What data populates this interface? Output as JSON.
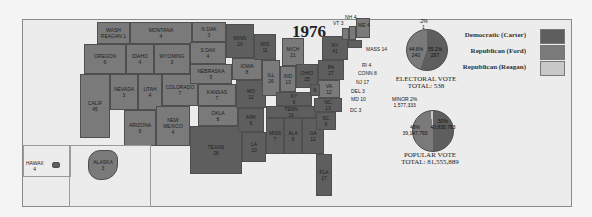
{
  "title": "1976",
  "legend": [
    {
      "label": "Democratic (Carter)",
      "color": "#5e5e5e"
    },
    {
      "label": "Republican (Ford)",
      "color": "#7a7a7a"
    },
    {
      "label": "Republican (Reagan)",
      "color": "#c8c8c8"
    }
  ],
  "electoral": {
    "caption": "ELECTORAL VOTE",
    "total": "TOTAL: 538",
    "ford_pct": "44.6%",
    "ford_votes": "240",
    "carter_pct": "55.2%",
    "carter_votes": "297",
    "reagan_pct": ".2%",
    "reagan_votes": "1"
  },
  "popular": {
    "caption": "POPULAR VOTE",
    "total": "TOTAL: 81,555,889",
    "minor_label": "MINOR 2%",
    "minor_votes": "1,577,333",
    "ford_pct": "48%",
    "ford_votes": "39,147,793",
    "carter_pct": "50%",
    "carter_votes": "40,830,763"
  },
  "states": {
    "wa": {
      "name": "WASH",
      "votes": "8",
      "note": "REAGAN 1"
    },
    "or": {
      "name": "OREGON",
      "votes": "6"
    },
    "ca": {
      "name": "CALIF",
      "votes": "45"
    },
    "nv": {
      "name": "NEVADA",
      "votes": "3"
    },
    "id": {
      "name": "IDAHO",
      "votes": "4"
    },
    "mt": {
      "name": "MONTANA",
      "votes": "4"
    },
    "wy": {
      "name": "WYOMING",
      "votes": "3"
    },
    "ut": {
      "name": "UTAH",
      "votes": "4"
    },
    "co": {
      "name": "COLORADO",
      "votes": "7"
    },
    "az": {
      "name": "ARIZONA",
      "votes": "6"
    },
    "nm": {
      "name": "NEW MEXICO",
      "votes": "4"
    },
    "nd": {
      "name": "N DAK",
      "votes": "3"
    },
    "sd": {
      "name": "S DAK",
      "votes": "4"
    },
    "ne": {
      "name": "NEBRASKA",
      "votes": "5"
    },
    "ks": {
      "name": "KANSAS",
      "votes": "7"
    },
    "ok": {
      "name": "OKLA",
      "votes": "8"
    },
    "tx": {
      "name": "TEXAS",
      "votes": "26"
    },
    "mn": {
      "name": "MINN",
      "votes": "10"
    },
    "ia": {
      "name": "IOWA",
      "votes": "8"
    },
    "mo": {
      "name": "MO",
      "votes": "12"
    },
    "ar": {
      "name": "ARK",
      "votes": "6"
    },
    "la": {
      "name": "LA",
      "votes": "10"
    },
    "wi": {
      "name": "WIS",
      "votes": "11"
    },
    "il": {
      "name": "ILL",
      "votes": "26"
    },
    "mi": {
      "name": "MICH",
      "votes": "21"
    },
    "in": {
      "name": "IND",
      "votes": "13"
    },
    "oh": {
      "name": "OHIO",
      "votes": "25"
    },
    "ky": {
      "name": "KY",
      "votes": "9"
    },
    "tn": {
      "name": "TENN",
      "votes": "10"
    },
    "ms": {
      "name": "MISS",
      "votes": "7"
    },
    "al": {
      "name": "ALA",
      "votes": "9"
    },
    "ga": {
      "name": "GA",
      "votes": "12"
    },
    "fl": {
      "name": "FLA",
      "votes": "17"
    },
    "sc": {
      "name": "SC",
      "votes": "8"
    },
    "nc": {
      "name": "NC",
      "votes": "13"
    },
    "va": {
      "name": "VA",
      "votes": "12"
    },
    "wv": {
      "name": "W VA",
      "votes": "6"
    },
    "pa": {
      "name": "PA",
      "votes": "27"
    },
    "ny": {
      "name": "NY",
      "votes": "41"
    },
    "vt": {
      "name": "VT",
      "votes": "3"
    },
    "nh": {
      "name": "NH",
      "votes": "4"
    },
    "me": {
      "name": "ME",
      "votes": "4"
    },
    "ak": {
      "name": "ALASKA",
      "votes": "3"
    },
    "hi": {
      "name": "HAWAII",
      "votes": "4"
    }
  },
  "callouts": {
    "mass": "MASS 14",
    "ri": "RI 4",
    "conn": "CONN 8",
    "nj": "NJ 17",
    "del": "DEL 3",
    "md": "MD 10",
    "dc": "DC 3"
  }
}
